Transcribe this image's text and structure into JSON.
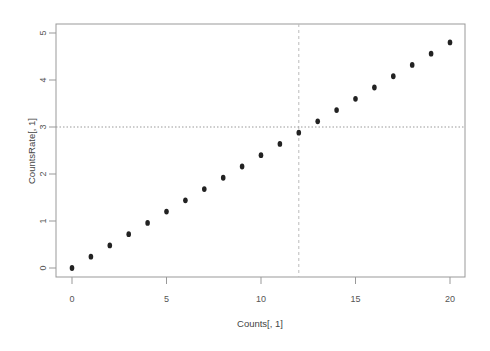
{
  "chart_data": {
    "type": "scatter",
    "title": "",
    "xlabel": "Counts[, 1]",
    "ylabel": "CountsRate[, 1]",
    "xlim": [
      -1,
      21
    ],
    "ylim": [
      -0.2,
      5.2
    ],
    "x_ticks": [
      0,
      5,
      10,
      15,
      20
    ],
    "y_ticks": [
      0,
      1,
      2,
      3,
      4,
      5
    ],
    "grid": false,
    "legend": null,
    "series": [
      {
        "name": "CountsRate",
        "x": [
          0,
          1,
          2,
          3,
          4,
          5,
          6,
          7,
          8,
          9,
          10,
          11,
          12,
          13,
          14,
          15,
          16,
          17,
          18,
          19,
          20
        ],
        "y": [
          0,
          0.24,
          0.48,
          0.72,
          0.96,
          1.2,
          1.44,
          1.68,
          1.92,
          2.16,
          2.4,
          2.64,
          2.88,
          3.12,
          3.36,
          3.6,
          3.84,
          4.08,
          4.32,
          4.56,
          4.8
        ]
      }
    ],
    "annotations": [
      {
        "type": "vline",
        "x": 12,
        "style": "dashed",
        "color": "#bbbbbb"
      },
      {
        "type": "hline",
        "y": 3,
        "style": "dotted",
        "color": "#999999"
      }
    ],
    "colors": {
      "points": "#222222",
      "axis": "#888888",
      "box": "#888888"
    }
  }
}
